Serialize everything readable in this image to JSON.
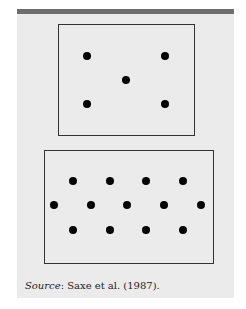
{
  "figure": {
    "top_array": {
      "dots": [
        [
          87,
          56
        ],
        [
          165,
          56
        ],
        [
          126,
          80
        ],
        [
          87,
          104
        ],
        [
          165,
          104
        ]
      ]
    },
    "bottom_array": {
      "dots": [
        [
          73,
          181
        ],
        [
          110,
          181
        ],
        [
          146,
          181
        ],
        [
          183,
          181
        ],
        [
          54,
          205
        ],
        [
          91,
          205
        ],
        [
          127,
          205
        ],
        [
          164,
          205
        ],
        [
          201,
          205
        ],
        [
          73,
          230
        ],
        [
          110,
          230
        ],
        [
          146,
          230
        ],
        [
          183,
          230
        ]
      ]
    },
    "caption": {
      "label": "Source",
      "text": ": Saxe et al. (1987)."
    }
  }
}
